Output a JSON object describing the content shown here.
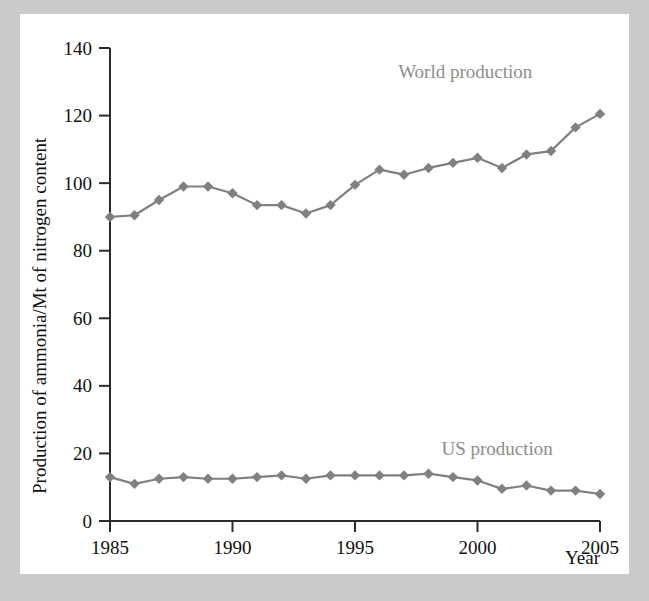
{
  "chart_data": {
    "type": "line",
    "title": "",
    "xlabel": "Year",
    "ylabel": "Production of ammonia/Mt of nitrogen content",
    "xlim": [
      1985,
      2005
    ],
    "ylim": [
      0,
      140
    ],
    "xticks": [
      1985,
      1990,
      1995,
      2000,
      2005
    ],
    "xtick_labels": [
      "1985",
      "1990",
      "1995",
      "2000",
      "2005"
    ],
    "yticks": [
      0,
      20,
      40,
      60,
      80,
      100,
      120,
      140
    ],
    "ytick_labels": [
      "0",
      "20",
      "40",
      "60",
      "80",
      "100",
      "120",
      "140"
    ],
    "grid": false,
    "legend_position": "inline-annotations",
    "marker": "diamond",
    "series_color": "#808080",
    "x": [
      1985,
      1986,
      1987,
      1988,
      1989,
      1990,
      1991,
      1992,
      1993,
      1994,
      1995,
      1996,
      1997,
      1998,
      1999,
      2000,
      2001,
      2002,
      2003,
      2004,
      2005
    ],
    "series": [
      {
        "name": "World production",
        "label": "World production",
        "color": "#808080",
        "values": [
          90,
          90.5,
          95,
          99,
          99,
          97,
          93.5,
          93.5,
          91,
          93.5,
          99.5,
          104,
          102.5,
          104.5,
          106,
          107.5,
          104.5,
          108.5,
          109.5,
          116.5,
          120.5
        ],
        "annotation_x": 1999.5,
        "annotation_y": 131
      },
      {
        "name": "US production",
        "label": "US production",
        "color": "#808080",
        "values": [
          13,
          11,
          12.5,
          13,
          12.5,
          12.5,
          13,
          13.5,
          12.5,
          13.5,
          13.5,
          13.5,
          13.5,
          14,
          13,
          12,
          9.5,
          10.5,
          9,
          9,
          8
        ]
      }
    ],
    "annotations": [
      {
        "text": "World production",
        "x": 1999.5,
        "y": 131
      },
      {
        "text": "US production",
        "x": 2000.8,
        "y": 19.5
      }
    ]
  },
  "figure": {
    "background": "#ffffff",
    "page_background": "#c9c9c9"
  }
}
